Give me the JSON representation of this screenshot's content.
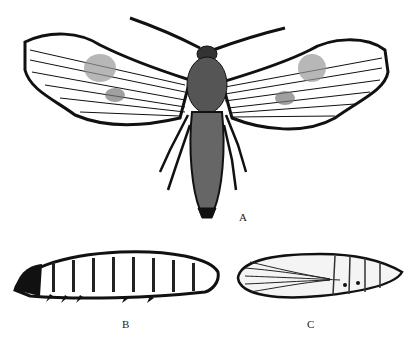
{
  "figure": {
    "panels": [
      {
        "id": "A",
        "label": "A",
        "subject": "adult-moth"
      },
      {
        "id": "B",
        "label": "B",
        "subject": "larva"
      },
      {
        "id": "C",
        "label": "C",
        "subject": "pupa"
      }
    ]
  },
  "colors": {
    "ink": "#111111",
    "paper": "#ffffff"
  }
}
